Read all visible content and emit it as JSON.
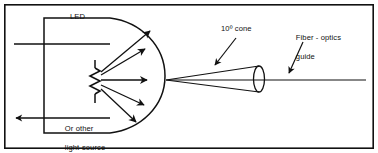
{
  "figure": {
    "background_color": "#ffffff",
    "ink_color": "#111111",
    "frame": {
      "name": "outer-border",
      "x": 4,
      "y": 4,
      "width": 370,
      "height": 145
    }
  },
  "labels": {
    "led": "LED",
    "source_line1": "Or other",
    "source_line2": "light-source",
    "cone": "10º cone",
    "fiber_line1": "Fiber - optics",
    "fiber_line2": "guide"
  },
  "diagram": {
    "led_body": {
      "name": "led-package",
      "description": "rectangular LED body with domed right end",
      "rect": {
        "x": 44,
        "y": 18,
        "width": 66,
        "height": 115
      },
      "dome_center_y": 76,
      "dome_right_x": 165
    },
    "leads": [
      {
        "name": "anode-lead",
        "y": 44,
        "from_x": 14,
        "to_x": 110
      },
      {
        "name": "cathode-lead",
        "y": 118,
        "from_x": 14,
        "to_x": 110,
        "arrow": "left"
      }
    ],
    "resistor": {
      "name": "resistor-symbol",
      "x": 95,
      "y_top": 66,
      "y_bottom": 96,
      "zigzags": 6
    },
    "light_rays": [
      {
        "name": "ray-up-far",
        "x1": 101,
        "y1": 72,
        "x2": 152,
        "y2": 30
      },
      {
        "name": "ray-up-near",
        "x1": 101,
        "y1": 74,
        "x2": 147,
        "y2": 48
      },
      {
        "name": "ray-center",
        "x1": 101,
        "y1": 80,
        "x2": 149,
        "y2": 80
      },
      {
        "name": "ray-down-near",
        "x1": 101,
        "y1": 84,
        "x2": 146,
        "y2": 107
      },
      {
        "name": "ray-down-far",
        "x1": 101,
        "y1": 88,
        "x2": 137,
        "y2": 124
      }
    ],
    "cone": {
      "name": "light-cone",
      "apex_x": 166,
      "apex_y": 80,
      "base_center_x": 259,
      "base_center_y": 79,
      "base_rx": 5.5,
      "base_ry": 13,
      "angle_degrees": 10
    },
    "fiber_axis": {
      "name": "fiber-axis-line",
      "y": 80,
      "from_x": 166,
      "to_x": 366
    },
    "leaders": [
      {
        "name": "cone-leader",
        "x1": 234,
        "y1": 40,
        "x2": 216,
        "y2": 66
      },
      {
        "name": "fiber-leader",
        "x1": 302,
        "y1": 44,
        "x2": 289,
        "y2": 74
      }
    ]
  }
}
